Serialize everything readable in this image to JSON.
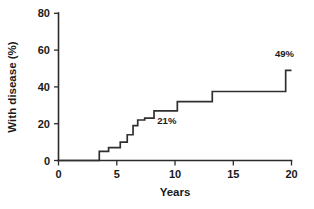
{
  "chart_data": {
    "type": "line",
    "subtype": "step",
    "title": "",
    "xlabel": "Years",
    "ylabel": "With disease (%)",
    "xlim": [
      0,
      20
    ],
    "ylim": [
      0,
      80
    ],
    "xticks": [
      0,
      5,
      10,
      15,
      20
    ],
    "yticks": [
      0,
      20,
      40,
      60,
      80
    ],
    "xtick_labels": [
      "0",
      "5",
      "10",
      "15",
      "20"
    ],
    "ytick_labels": [
      "0",
      "20",
      "40",
      "60",
      "80"
    ],
    "grid": false,
    "legend": false,
    "series": [
      {
        "name": "Cumulative incidence",
        "x": [
          0,
          3.5,
          3.5,
          4.3,
          4.3,
          5.3,
          5.3,
          5.9,
          5.9,
          6.4,
          6.4,
          6.8,
          6.8,
          7.4,
          7.4,
          8.2,
          8.2,
          10.2,
          10.2,
          13.2,
          13.2,
          19.5,
          19.5,
          20.0
        ],
        "y": [
          0,
          0,
          5,
          5,
          7,
          7,
          10,
          10,
          14,
          14,
          19,
          19,
          22,
          22,
          23,
          23,
          27,
          27,
          32,
          32,
          37.5,
          37.5,
          49,
          49
        ]
      }
    ],
    "annotations": [
      {
        "text": "21%",
        "x": 9.3,
        "y": 20,
        "name": "annotation-21-percent"
      },
      {
        "text": "49%",
        "x": 19.4,
        "y": 56,
        "name": "annotation-49-percent"
      }
    ],
    "colors": {
      "line": "#303030",
      "axis": "#2b2b2b",
      "text": "#1a1a1a",
      "background": "#ffffff"
    }
  }
}
